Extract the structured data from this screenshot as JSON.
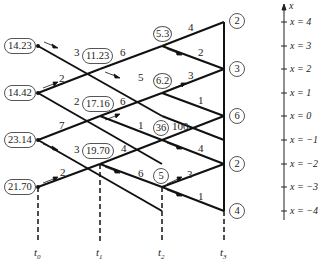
{
  "diagram": {
    "time_labels": [
      "t0",
      "t1",
      "t2",
      "t3"
    ],
    "axis": {
      "label": "x",
      "levels": [
        "x = 4",
        "x = 3",
        "x = 2",
        "x = 1",
        "x = 0",
        "x = −1",
        "x = −2",
        "x = −3",
        "x = −4"
      ]
    },
    "nodes": {
      "t0": [
        {
          "x": 3,
          "value": "14.23"
        },
        {
          "x": 1,
          "value": "14.42"
        },
        {
          "x": -1,
          "value": "23.14"
        },
        {
          "x": -3,
          "value": "21.70"
        }
      ],
      "t1": [
        {
          "x": 2,
          "value": "11.23"
        },
        {
          "x": 0,
          "value": "17.16"
        },
        {
          "x": -2,
          "value": "19.70"
        }
      ],
      "t2": [
        {
          "x": 3,
          "value": "5.3"
        },
        {
          "x": 1,
          "value": "6.2"
        },
        {
          "x": -1,
          "value": "36"
        },
        {
          "x": -3,
          "value": "5"
        }
      ],
      "t3": [
        {
          "x": 4,
          "value": "2"
        },
        {
          "x": 2,
          "value": "3"
        },
        {
          "x": 0,
          "value": "6"
        },
        {
          "x": -2,
          "value": "2"
        },
        {
          "x": -4,
          "value": "4"
        }
      ]
    },
    "edge_costs": {
      "t0_14.23_down": "3",
      "t0_14.42_up": "2",
      "t0_14.42_down": "2",
      "t0_23.14_up": "7",
      "t0_23.14_down": "3",
      "t0_21.70_up": "2",
      "t1_11.23_up": "6",
      "t1_11.23_down": "5",
      "t1_17.16_up": "6",
      "t1_17.16_down": "1",
      "t1_19.70_up": "4",
      "t1_19.70_down": "6",
      "t2_5.3_up": "4",
      "t2_5.3_down": "2",
      "t2_6.2_up": "3",
      "t2_6.2_down": "1",
      "t2_36_up": "100",
      "t2_36_down": "4",
      "t2_5_up": "3",
      "t2_5_down": "1"
    }
  }
}
